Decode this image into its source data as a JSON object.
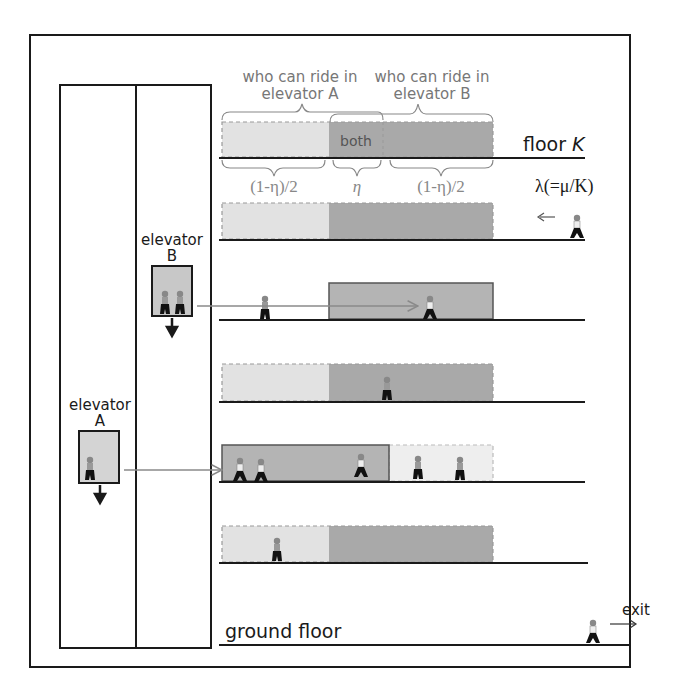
{
  "labels": {
    "who_a_line1": "who can ride in",
    "who_a_line2": "elevator A",
    "who_b_line1": "who can ride in",
    "who_b_line2": "elevator B",
    "both": "both",
    "floor_k": "floor ",
    "floor_k_var": "K",
    "frac_left": "(1-η)/2",
    "eta": "η",
    "frac_right": "(1-η)/2",
    "lambda": "λ(=μ/K)",
    "elevator_b_line1": "elevator",
    "elevator_b_line2": "B",
    "elevator_a_line1": "elevator",
    "elevator_a_line2": "A",
    "ground_floor": "ground floor",
    "exit": "exit"
  },
  "colors": {
    "light_zone": "#e2e2e2",
    "dark_zone": "#a9a9a9",
    "line": "#1a1a1a",
    "label_gray": "#777777",
    "arrow_gray": "#8a8a8a"
  },
  "floors": [
    {
      "id": "floor-k",
      "y": 158,
      "style": "dashed-both"
    },
    {
      "id": "floor-2",
      "y": 240,
      "style": "dashed-both"
    },
    {
      "id": "floor-3",
      "y": 320,
      "style": "solid-right-highlight"
    },
    {
      "id": "floor-4",
      "y": 402,
      "style": "dashed-both"
    },
    {
      "id": "floor-5",
      "y": 482,
      "style": "solid-left-highlight"
    },
    {
      "id": "floor-6",
      "y": 563,
      "style": "dashed-both"
    },
    {
      "id": "ground",
      "y": 645,
      "style": "none"
    }
  ]
}
